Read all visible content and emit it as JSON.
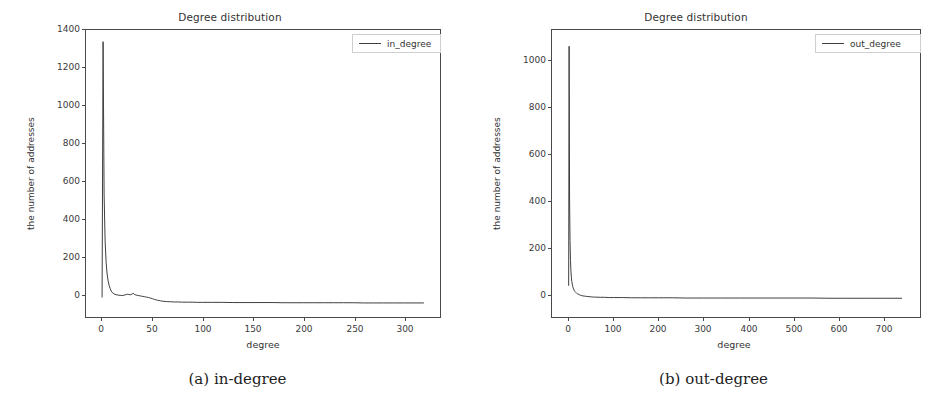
{
  "figure": {
    "background": "#ffffff",
    "line_color": "#3f3f3f",
    "axis_color": "#4a4a4a",
    "text_color": "#333333"
  },
  "panels": [
    {
      "id": "panel-a",
      "subcaption": "(a) in-degree",
      "chart_data": {
        "type": "line",
        "title": "Degree distribution",
        "xlabel": "degree",
        "ylabel": "the number of addresses",
        "xlim": [
          -16,
          336
        ],
        "ylim": [
          -70,
          1400
        ],
        "xticks": [
          0,
          50,
          100,
          150,
          200,
          250,
          300
        ],
        "yticks": [
          0,
          200,
          400,
          600,
          800,
          1000,
          1200,
          1400
        ],
        "grid": false,
        "legend_position": "upper right",
        "series": [
          {
            "name": "in_degree",
            "color": "#3f3f3f",
            "x": [
              0,
              1,
              2,
              3,
              4,
              5,
              6,
              7,
              8,
              9,
              10,
              12,
              14,
              16,
              18,
              20,
              22,
              24,
              25,
              26,
              28,
              30,
              31,
              32,
              34,
              36,
              38,
              40,
              42,
              44,
              46,
              48,
              50,
              52,
              55,
              58,
              60,
              64,
              68,
              72,
              76,
              80,
              85,
              90,
              95,
              100,
              110,
              120,
              130,
              140,
              150,
              160,
              170,
              180,
              190,
              200,
              210,
              220,
              230,
              240,
              250,
              260,
              270,
              280,
              290,
              300,
              310,
              320
            ],
            "values": [
              30,
              1340,
              560,
              320,
              210,
              150,
              115,
              92,
              76,
              64,
              56,
              48,
              44,
              42,
              41,
              40,
              42,
              45,
              47,
              46,
              44,
              48,
              52,
              46,
              42,
              40,
              38,
              36,
              34,
              32,
              30,
              27,
              24,
              20,
              16,
              13,
              11,
              9,
              8,
              7,
              7,
              6,
              6,
              6,
              5,
              5,
              5,
              5,
              4,
              4,
              4,
              4,
              4,
              3,
              3,
              3,
              3,
              3,
              3,
              3,
              3,
              2,
              2,
              2,
              2,
              2,
              2,
              2
            ]
          }
        ]
      }
    },
    {
      "id": "panel-b",
      "subcaption": "(b) out-degree",
      "chart_data": {
        "type": "line",
        "title": "Degree distribution",
        "xlabel": "degree",
        "ylabel": "the number of addresses",
        "xlim": [
          -37,
          780
        ],
        "ylim": [
          -80,
          1160
        ],
        "xticks": [
          0,
          100,
          200,
          300,
          400,
          500,
          600,
          700
        ],
        "yticks": [
          0,
          200,
          400,
          600,
          800,
          1000
        ],
        "grid": false,
        "legend_position": "upper right",
        "series": [
          {
            "name": "out_degree",
            "color": "#3f3f3f",
            "x": [
              0,
              1,
              2,
              3,
              4,
              5,
              6,
              7,
              8,
              9,
              10,
              12,
              14,
              16,
              18,
              20,
              24,
              28,
              32,
              36,
              40,
              45,
              50,
              55,
              60,
              70,
              80,
              90,
              100,
              120,
              140,
              160,
              180,
              200,
              230,
              260,
              300,
              340,
              380,
              420,
              460,
              500,
              540,
              580,
              620,
              660,
              700,
              740
            ],
            "values": [
              55,
              1090,
              430,
              250,
              165,
              120,
              92,
              74,
              62,
              52,
              45,
              36,
              30,
              26,
              22,
              20,
              16,
              13,
              11,
              10,
              9,
              8,
              7,
              6,
              6,
              5,
              5,
              4,
              4,
              4,
              3,
              3,
              3,
              3,
              3,
              2,
              2,
              2,
              2,
              2,
              2,
              2,
              2,
              1,
              1,
              1,
              1,
              1
            ]
          }
        ]
      }
    }
  ]
}
